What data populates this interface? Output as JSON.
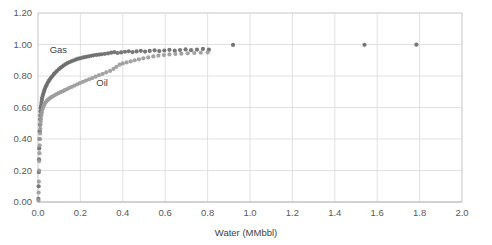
{
  "chart_data": {
    "type": "scatter",
    "title": "",
    "xlabel": "Water (MMbbl)",
    "ylabel": "",
    "xlim": [
      0.0,
      2.0
    ],
    "ylim": [
      0.0,
      1.2
    ],
    "xticks": [
      "0.0",
      "0.2",
      "0.4",
      "0.6",
      "0.8",
      "1.0",
      "1.2",
      "1.4",
      "1.6",
      "1.8",
      "2.0"
    ],
    "xtick_values": [
      0.0,
      0.2,
      0.4,
      0.6,
      0.8,
      1.0,
      1.2,
      1.4,
      1.6,
      1.8,
      2.0
    ],
    "yticks": [
      "0.00",
      "0.20",
      "0.40",
      "0.60",
      "0.80",
      "1.00",
      "1.20"
    ],
    "ytick_values": [
      0.0,
      0.2,
      0.4,
      0.6,
      0.8,
      1.0,
      1.2
    ],
    "grid": true,
    "legend_position": "inline-annotations",
    "annotations": [
      {
        "name": "Gas",
        "x": 0.055,
        "y": 0.945,
        "color": "#6e6e6e"
      },
      {
        "name": "Oil",
        "x": 0.275,
        "y": 0.735,
        "color": "#6e6e6e"
      }
    ],
    "series": [
      {
        "name": "Gas",
        "color": "#6b6b6b",
        "marker": "circle",
        "marker_size": 4.2,
        "points": [
          [
            0.002,
            0.02
          ],
          [
            0.003,
            0.1
          ],
          [
            0.004,
            0.19
          ],
          [
            0.005,
            0.27
          ],
          [
            0.006,
            0.34
          ],
          [
            0.007,
            0.4
          ],
          [
            0.008,
            0.45
          ],
          [
            0.009,
            0.49
          ],
          [
            0.01,
            0.525
          ],
          [
            0.011,
            0.55
          ],
          [
            0.012,
            0.575
          ],
          [
            0.013,
            0.595
          ],
          [
            0.014,
            0.61
          ],
          [
            0.016,
            0.63
          ],
          [
            0.018,
            0.648
          ],
          [
            0.02,
            0.663
          ],
          [
            0.023,
            0.678
          ],
          [
            0.026,
            0.692
          ],
          [
            0.029,
            0.705
          ],
          [
            0.032,
            0.717
          ],
          [
            0.036,
            0.73
          ],
          [
            0.04,
            0.742
          ],
          [
            0.045,
            0.755
          ],
          [
            0.05,
            0.767
          ],
          [
            0.056,
            0.779
          ],
          [
            0.062,
            0.79
          ],
          [
            0.068,
            0.8
          ],
          [
            0.075,
            0.812
          ],
          [
            0.082,
            0.822
          ],
          [
            0.09,
            0.833
          ],
          [
            0.098,
            0.843
          ],
          [
            0.106,
            0.852
          ],
          [
            0.114,
            0.86
          ],
          [
            0.122,
            0.868
          ],
          [
            0.131,
            0.876
          ],
          [
            0.14,
            0.883
          ],
          [
            0.15,
            0.889
          ],
          [
            0.16,
            0.895
          ],
          [
            0.17,
            0.9
          ],
          [
            0.18,
            0.905
          ],
          [
            0.191,
            0.91
          ],
          [
            0.202,
            0.914
          ],
          [
            0.214,
            0.918
          ],
          [
            0.226,
            0.921
          ],
          [
            0.238,
            0.925
          ],
          [
            0.25,
            0.928
          ],
          [
            0.262,
            0.931
          ],
          [
            0.275,
            0.934
          ],
          [
            0.288,
            0.936
          ],
          [
            0.3,
            0.938
          ],
          [
            0.315,
            0.941
          ],
          [
            0.33,
            0.944
          ],
          [
            0.345,
            0.948
          ],
          [
            0.36,
            0.952
          ],
          [
            0.375,
            0.946
          ],
          [
            0.392,
            0.95
          ],
          [
            0.41,
            0.954
          ],
          [
            0.428,
            0.957
          ],
          [
            0.446,
            0.952
          ],
          [
            0.465,
            0.956
          ],
          [
            0.485,
            0.96
          ],
          [
            0.505,
            0.955
          ],
          [
            0.527,
            0.959
          ],
          [
            0.55,
            0.963
          ],
          [
            0.572,
            0.958
          ],
          [
            0.596,
            0.962
          ],
          [
            0.62,
            0.966
          ],
          [
            0.645,
            0.961
          ],
          [
            0.67,
            0.965
          ],
          [
            0.696,
            0.969
          ],
          [
            0.722,
            0.964
          ],
          [
            0.75,
            0.968
          ],
          [
            0.778,
            0.972
          ],
          [
            0.806,
            0.967
          ],
          [
            0.92,
            0.997
          ],
          [
            1.54,
            0.998
          ],
          [
            1.785,
            0.999
          ]
        ]
      },
      {
        "name": "Oil",
        "color": "#9b9b9b",
        "marker": "circle",
        "marker_size": 4.2,
        "points": [
          [
            0.002,
            0.01
          ],
          [
            0.003,
            0.06
          ],
          [
            0.004,
            0.13
          ],
          [
            0.005,
            0.2
          ],
          [
            0.006,
            0.26
          ],
          [
            0.007,
            0.31
          ],
          [
            0.008,
            0.36
          ],
          [
            0.009,
            0.4
          ],
          [
            0.01,
            0.435
          ],
          [
            0.011,
            0.465
          ],
          [
            0.012,
            0.49
          ],
          [
            0.013,
            0.51
          ],
          [
            0.014,
            0.528
          ],
          [
            0.016,
            0.55
          ],
          [
            0.018,
            0.568
          ],
          [
            0.021,
            0.585
          ],
          [
            0.024,
            0.6
          ],
          [
            0.028,
            0.613
          ],
          [
            0.032,
            0.624
          ],
          [
            0.036,
            0.633
          ],
          [
            0.041,
            0.641
          ],
          [
            0.046,
            0.648
          ],
          [
            0.052,
            0.655
          ],
          [
            0.058,
            0.661
          ],
          [
            0.065,
            0.667
          ],
          [
            0.072,
            0.673
          ],
          [
            0.08,
            0.679
          ],
          [
            0.088,
            0.685
          ],
          [
            0.097,
            0.691
          ],
          [
            0.106,
            0.697
          ],
          [
            0.116,
            0.703
          ],
          [
            0.126,
            0.71
          ],
          [
            0.137,
            0.717
          ],
          [
            0.148,
            0.724
          ],
          [
            0.16,
            0.731
          ],
          [
            0.172,
            0.739
          ],
          [
            0.185,
            0.747
          ],
          [
            0.198,
            0.755
          ],
          [
            0.212,
            0.763
          ],
          [
            0.226,
            0.771
          ],
          [
            0.241,
            0.779
          ],
          [
            0.256,
            0.787
          ],
          [
            0.272,
            0.796
          ],
          [
            0.288,
            0.805
          ],
          [
            0.305,
            0.814
          ],
          [
            0.322,
            0.823
          ],
          [
            0.34,
            0.832
          ],
          [
            0.356,
            0.845
          ],
          [
            0.37,
            0.858
          ],
          [
            0.385,
            0.872
          ],
          [
            0.4,
            0.88
          ],
          [
            0.418,
            0.886
          ],
          [
            0.437,
            0.893
          ],
          [
            0.456,
            0.9
          ],
          [
            0.476,
            0.906
          ],
          [
            0.497,
            0.912
          ],
          [
            0.52,
            0.918
          ],
          [
            0.544,
            0.924
          ],
          [
            0.568,
            0.929
          ],
          [
            0.594,
            0.933
          ],
          [
            0.62,
            0.937
          ],
          [
            0.648,
            0.94
          ],
          [
            0.676,
            0.942
          ],
          [
            0.706,
            0.944
          ],
          [
            0.737,
            0.946
          ],
          [
            0.768,
            0.948
          ],
          [
            0.8,
            0.95
          ]
        ]
      }
    ]
  },
  "axes": {
    "x_title": "Water (MMbbl)"
  }
}
